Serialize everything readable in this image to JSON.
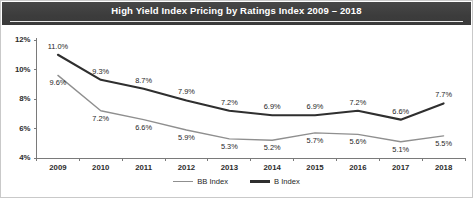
{
  "title": "High Yield Index Pricing by Ratings Index 2009 – 2018",
  "colors": {
    "title_bar": "#3f3f3f",
    "title_text": "#ffffff",
    "bb_index_line": "#8f8f8f",
    "b_index_line": "#2f2f2f",
    "axis": "#7a7a7a",
    "background": "#ffffff"
  },
  "axes": {
    "y_ticks": [
      "12%",
      "10%",
      "8%",
      "6%",
      "4%"
    ],
    "x_ticks": [
      "2009",
      "2010",
      "2011",
      "2012",
      "2013",
      "2014",
      "2015",
      "2016",
      "2017",
      "2018"
    ]
  },
  "legend": {
    "items": [
      {
        "label": "BB Index",
        "color": "#8f8f8f"
      },
      {
        "label": "B Index",
        "color": "#2f2f2f"
      }
    ]
  },
  "chart_data": {
    "type": "line",
    "title": "High Yield Index Pricing by Ratings Index 2009 – 2018",
    "xlabel": "",
    "ylabel": "",
    "ylim": [
      4,
      12
    ],
    "ytick_values": [
      12,
      10,
      8,
      6,
      4
    ],
    "ytick_labels": [
      "12%",
      "10%",
      "8%",
      "6%",
      "4%"
    ],
    "grid": false,
    "legend_position": "bottom-center",
    "categories": [
      "2009",
      "2010",
      "2011",
      "2012",
      "2013",
      "2014",
      "2015",
      "2016",
      "2017",
      "2018"
    ],
    "series": [
      {
        "name": "BB Index",
        "color": "#8f8f8f",
        "values": [
          9.6,
          7.2,
          6.6,
          5.9,
          5.3,
          5.2,
          5.7,
          5.6,
          5.1,
          5.5
        ],
        "labels": [
          "9.6%",
          "7.2%",
          "6.6%",
          "5.9%",
          "5.3%",
          "5.2%",
          "5.7%",
          "5.6%",
          "5.1%",
          "5.5%"
        ],
        "label_position": "below"
      },
      {
        "name": "B Index",
        "color": "#2f2f2f",
        "values": [
          11.0,
          9.3,
          8.7,
          7.9,
          7.2,
          6.9,
          6.9,
          7.2,
          6.6,
          7.7
        ],
        "labels": [
          "11.0%",
          "9.3%",
          "8.7%",
          "7.9%",
          "7.2%",
          "6.9%",
          "6.9%",
          "7.2%",
          "6.6%",
          "7.7%"
        ],
        "label_position": "above"
      }
    ]
  }
}
